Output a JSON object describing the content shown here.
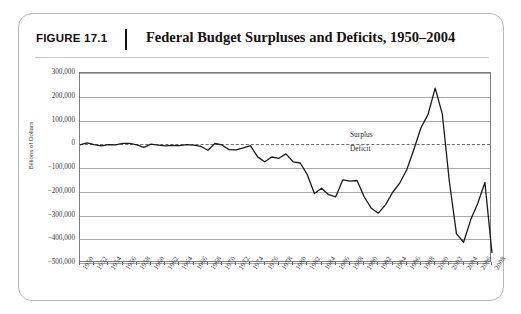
{
  "figure": {
    "number_label": "FIGURE 17.1",
    "title": "Federal Budget Surpluses and Deficits, 1950–2004"
  },
  "chart_data": {
    "type": "line",
    "title": "Federal Budget Surpluses and Deficits, 1950–2004",
    "xlabel": "",
    "ylabel": "Billions of Dollars",
    "xlim": [
      1950,
      2008
    ],
    "ylim": [
      -500000,
      300000
    ],
    "grid": true,
    "legend": "none",
    "ytick_labels": [
      "300,000",
      "200,000",
      "100,000",
      "0",
      "−100,000",
      "−200,000",
      "−300,000",
      "−400,000",
      "−500,000"
    ],
    "ytick_values": [
      300000,
      200000,
      100000,
      0,
      -100000,
      -200000,
      -300000,
      -400000,
      -500000
    ],
    "xtick_labels": [
      "1950",
      "1952",
      "1954",
      "1956",
      "1958",
      "1960",
      "1962",
      "1964",
      "1966",
      "1968",
      "1970",
      "1972",
      "1974",
      "1976",
      "1978",
      "1980",
      "1982",
      "1984",
      "1986",
      "1988",
      "1990",
      "1992",
      "1994",
      "1996",
      "1998",
      "2000",
      "2002",
      "2004",
      "2006",
      "2008"
    ],
    "xtick_values": [
      1950,
      1952,
      1954,
      1956,
      1958,
      1960,
      1962,
      1964,
      1966,
      1968,
      1970,
      1972,
      1974,
      1976,
      1978,
      1980,
      1982,
      1984,
      1986,
      1988,
      1990,
      1992,
      1994,
      1996,
      1998,
      2000,
      2002,
      2004,
      2006,
      2008
    ],
    "annotations": [
      {
        "text": "Surplus",
        "x": 1988,
        "y": 40000
      },
      {
        "text": "Deficit",
        "x": 1988,
        "y": -22000
      }
    ],
    "zero_reference_line": 0,
    "series": [
      {
        "name": "Federal Budget Surplus/Deficit",
        "color": "#1a1a1a",
        "x": [
          1950,
          1951,
          1952,
          1953,
          1954,
          1955,
          1956,
          1957,
          1958,
          1959,
          1960,
          1961,
          1962,
          1963,
          1964,
          1965,
          1966,
          1967,
          1968,
          1969,
          1970,
          1971,
          1972,
          1973,
          1974,
          1975,
          1976,
          1977,
          1978,
          1979,
          1980,
          1981,
          1982,
          1983,
          1984,
          1985,
          1986,
          1987,
          1988,
          1989,
          1990,
          1991,
          1992,
          1993,
          1994,
          1995,
          1996,
          1997,
          1998,
          1999,
          2000,
          2001,
          2002,
          2003,
          2004,
          2005,
          2006,
          2007,
          2008
        ],
        "values": [
          -3100,
          6100,
          -1500,
          -6500,
          -1200,
          -3000,
          3900,
          3400,
          -2800,
          -12800,
          300,
          -3300,
          -7100,
          -4800,
          -5900,
          -1400,
          -3700,
          -8600,
          -25200,
          3200,
          -2800,
          -23000,
          -23400,
          -14900,
          -6100,
          -53200,
          -73700,
          -53700,
          -59200,
          -40700,
          -73800,
          -79000,
          -128000,
          -207800,
          -185400,
          -212300,
          -221200,
          -149700,
          -155200,
          -152600,
          -221200,
          -269200,
          -290300,
          -255100,
          -203200,
          -164000,
          -107400,
          -21900,
          69300,
          125600,
          236200,
          128200,
          -157800,
          -377600,
          -412700,
          -318300,
          -248200,
          -160700,
          -458600
        ]
      }
    ]
  }
}
